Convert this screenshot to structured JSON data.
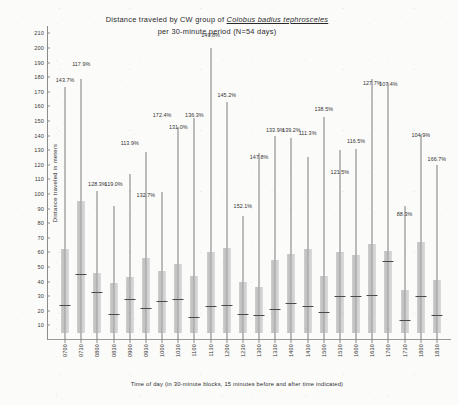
{
  "chart_data": {
    "type": "bar",
    "title": "Distance traveled by CW group of Colobus badius tephrosceles per 30-minute period (N=54 days)",
    "title_lines": [
      {
        "pre": "Distance traveled by CW group of ",
        "species": "Colobus badius tephrosceles"
      },
      {
        "pre": "per 30-minute period (N=54 days)",
        "species": ""
      }
    ],
    "xlabel": "Time of day (in 30-minute blocks, 15 minutes before and after time indicated)",
    "ylabel": "Distance traveled in meters",
    "ylim": [
      0,
      215
    ],
    "ytick_values": [
      10,
      20,
      30,
      40,
      50,
      60,
      70,
      80,
      90,
      100,
      110,
      120,
      130,
      140,
      150,
      160,
      170,
      180,
      190,
      200,
      210
    ],
    "grid": false,
    "legend": "none",
    "categories": [
      "0700",
      "0730",
      "0800",
      "0830",
      "0900",
      "0930",
      "1000",
      "1030",
      "1100",
      "1130",
      "1200",
      "1230",
      "1300",
      "1330",
      "1400",
      "1430",
      "1500",
      "1530",
      "1600",
      "1630",
      "1700",
      "1730",
      "1800",
      "1830"
    ],
    "series": [
      {
        "name": "Distance traveled per 30-min block",
        "box_top": [
          62,
          95,
          46,
          39,
          43,
          56,
          47,
          52,
          44,
          60,
          63,
          40,
          36,
          55,
          59,
          62,
          44,
          60,
          58,
          66,
          61,
          34,
          67,
          41
        ],
        "box_bottom": [
          5,
          5,
          5,
          5,
          5,
          5,
          5,
          5,
          5,
          5,
          5,
          5,
          5,
          5,
          5,
          5,
          5,
          5,
          5,
          5,
          5,
          5,
          5,
          5
        ],
        "median": [
          24,
          45,
          33,
          18,
          28,
          22,
          27,
          28,
          16,
          23,
          24,
          18,
          17,
          21,
          25,
          23,
          19,
          30,
          30,
          31,
          54,
          14,
          30,
          17
        ],
        "whisker_top": [
          173,
          179,
          102,
          92,
          114,
          129,
          101,
          146,
          152,
          200,
          163,
          85,
          128,
          140,
          138,
          125,
          153,
          130,
          131,
          179,
          176,
          92,
          141,
          120
        ],
        "labels": [
          "143.7%",
          "117.9%",
          "128.3%",
          "119.0%",
          "113.9%",
          "132.7%",
          "172.4%",
          "131.0%",
          "136.3%",
          "149.8%",
          "145.2%",
          "152.1%",
          "147.8%",
          "133.9%",
          "139.2%",
          "111.3%",
          "138.5%",
          "121.5%",
          "116.5%",
          "127.7%",
          "107.4%",
          "88.3%",
          "104.9%",
          "166.7%"
        ],
        "label_heights": [
          176,
          187,
          105,
          105,
          133,
          97,
          152,
          144,
          152,
          207,
          166,
          90,
          123,
          142,
          142,
          140,
          156,
          113,
          134,
          174,
          173,
          84,
          138,
          122
        ]
      }
    ]
  },
  "meta": {
    "y_axis_caption": "Distance traveled in meters",
    "x_axis_caption": "Time of day (in 30-minute blocks, 15 minutes before and after time indicated)"
  }
}
